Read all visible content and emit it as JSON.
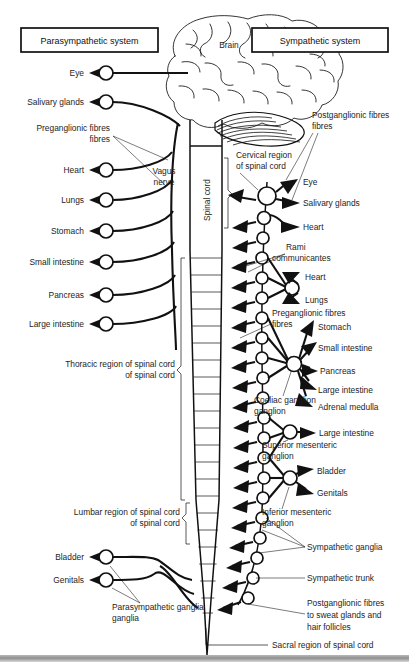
{
  "diagram": {
    "headers": [
      {
        "label": "Parasympathetic system",
        "side": "left"
      },
      {
        "label": "Sympathetic system",
        "side": "right"
      }
    ],
    "anatomy_labels": {
      "brain": "Brain",
      "spinal_cord": "Spinal cord",
      "vagus_nerve": "Vagus nerve"
    },
    "parasympathetic": {
      "targets": [
        {
          "label": "Eye",
          "y": 73
        },
        {
          "label": "Salivary glands",
          "y": 102
        },
        {
          "label": "Heart",
          "y": 170
        },
        {
          "label": "Lungs",
          "y": 200
        },
        {
          "label": "Stomach",
          "y": 231
        },
        {
          "label": "Small intestine",
          "y": 262
        },
        {
          "label": "Pancreas",
          "y": 295
        },
        {
          "label": "Large intestine",
          "y": 324
        }
      ],
      "sacral_targets": [
        {
          "label": "Bladder",
          "y": 557
        },
        {
          "label": "Genitals",
          "y": 580
        }
      ],
      "callouts": [
        {
          "label": "Preganglionic fibres",
          "x": 62,
          "y": 130
        },
        {
          "label": "Parasympathetic ganglia",
          "x": 112,
          "y": 607
        }
      ]
    },
    "sympathetic": {
      "cervical_targets": [
        {
          "label": "Eye",
          "y": 182
        },
        {
          "label": "Salivary glands",
          "y": 203
        },
        {
          "label": "Heart",
          "y": 227
        }
      ],
      "thoracic_targets": [
        {
          "label": "Heart",
          "y": 277
        },
        {
          "label": "Lungs",
          "y": 300
        }
      ],
      "coeliac_targets": [
        {
          "label": "Stomach",
          "y": 327
        },
        {
          "label": "Small intestine",
          "y": 348
        },
        {
          "label": "Pancreas",
          "y": 369
        },
        {
          "label": "Large intestine",
          "y": 390
        },
        {
          "label": "Adrenal medulla",
          "y": 407
        }
      ],
      "sup_mesenteric_targets": [
        {
          "label": "Large intestine",
          "y": 435
        }
      ],
      "inf_mesenteric_targets": [
        {
          "label": "Bladder",
          "y": 471
        },
        {
          "label": "Genitals",
          "y": 492
        }
      ],
      "callouts": [
        {
          "label": "Postganglionic fibres",
          "x": 312,
          "y": 115
        },
        {
          "label": "Cervical region of spinal cord",
          "x": 238,
          "y": 158
        },
        {
          "label": "Rami communicantes",
          "x": 290,
          "y": 248
        },
        {
          "label": "Preganglionic fibres",
          "x": 277,
          "y": 313
        },
        {
          "label": "Coeliac ganglion",
          "x": 268,
          "y": 400
        },
        {
          "label": "Superior mesenteric ganglion",
          "x": 285,
          "y": 445
        },
        {
          "label": "Inferior mesenteric ganglion",
          "x": 285,
          "y": 512
        },
        {
          "label": "Sympathetic ganglia",
          "x": 306,
          "y": 547
        },
        {
          "label": "Sympathetic trunk",
          "x": 306,
          "y": 578
        },
        {
          "label": "Postganglionic fibres to sweat glands and hair follicles",
          "x": 306,
          "y": 604
        },
        {
          "label": "Sacral region of spinal cord",
          "x": 275,
          "y": 644
        }
      ]
    },
    "spinal_regions": [
      {
        "label": "Thoracic region of spinal cord",
        "x": 145,
        "y": 370
      },
      {
        "label": "Lumbar region of spinal cord",
        "x": 145,
        "y": 518
      }
    ],
    "colors": {
      "ink": "#111111",
      "paper": "#ffffff",
      "footer": "#9a9a9a"
    }
  }
}
